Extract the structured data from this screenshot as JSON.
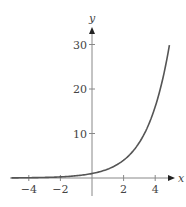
{
  "chart_data": {
    "type": "line",
    "title": "",
    "xlabel": "x",
    "ylabel": "y",
    "function": "y = 2^x",
    "xlim": [
      -5,
      5
    ],
    "ylim": [
      0,
      32
    ],
    "grid": false,
    "legend": null,
    "x_ticks": [
      -4,
      -2,
      2,
      4
    ],
    "x_tick_labels": [
      "−4",
      "−2",
      "2",
      "4"
    ],
    "y_ticks": [
      10,
      20,
      30
    ],
    "y_tick_labels": [
      "10",
      "20",
      "30"
    ],
    "series": [
      {
        "name": "y = 2^x",
        "color": "#555555",
        "x": [
          -5,
          -4,
          -3,
          -2,
          -1,
          0,
          1,
          2,
          3,
          4,
          4.5,
          4.9
        ],
        "y": [
          0.03,
          0.06,
          0.13,
          0.25,
          0.5,
          1,
          2,
          4,
          8,
          16,
          22.6,
          29.9
        ]
      }
    ]
  },
  "colors": {
    "axis": "#888888",
    "curve": "#555555",
    "text": "#444444"
  }
}
